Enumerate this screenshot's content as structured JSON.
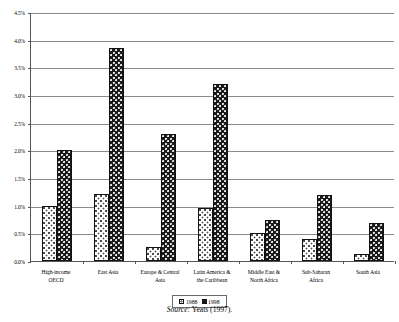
{
  "chart_data": {
    "type": "bar",
    "title": "",
    "subtitle": "",
    "xlabel": "",
    "ylabel": "",
    "ylim": [
      0.0,
      4.5
    ],
    "ytick_values": [
      4.5,
      4.0,
      3.5,
      3.0,
      2.5,
      2.0,
      1.5,
      1.0,
      0.5,
      0.0
    ],
    "ytick_labels": [
      "4.5%",
      "4.0%",
      "3.5%",
      "3.0%",
      "2.5%",
      "2.0%",
      "1.5%",
      "1.0%",
      "0.5%",
      "0.0%"
    ],
    "grid": true,
    "grid_axis": "y",
    "legend_position": "bottom",
    "categories": [
      "High-income OECD",
      "East Asia",
      "Europe & Central Asia",
      "Latin America & the Caribbean",
      "Middle East & North Africa",
      "Sub-Saharan Africa",
      "South Asia"
    ],
    "category_label_lines": [
      [
        "High-income",
        "OECD"
      ],
      [
        "East Asia",
        ""
      ],
      [
        "Europe & Central",
        "Asia"
      ],
      [
        "Latin America &",
        "the Caribbean"
      ],
      [
        "Middle East &",
        "North Africa"
      ],
      [
        "Sub-Saharan",
        "Africa"
      ],
      [
        "South Asia",
        ""
      ]
    ],
    "series": [
      {
        "name": "1988",
        "values": [
          1.0,
          1.22,
          0.25,
          0.95,
          0.5,
          0.4,
          0.12
        ]
      },
      {
        "name": "1998",
        "values": [
          2.0,
          3.85,
          2.3,
          3.2,
          0.75,
          1.2,
          0.68
        ]
      }
    ]
  },
  "legend": {
    "entries": [
      {
        "label": "1988",
        "swatch": "light-dotted-swatch"
      },
      {
        "label": "1998",
        "swatch": "dark-filled-swatch"
      }
    ]
  },
  "caption": {
    "source_word": "Source:",
    "source_text": " Yeats (1997)."
  }
}
